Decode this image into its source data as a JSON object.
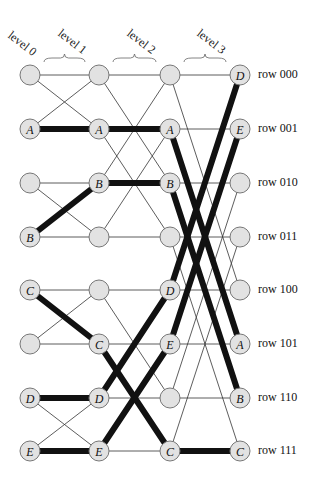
{
  "levels": [
    {
      "label": "level 0",
      "x": 30
    },
    {
      "label": "level 1",
      "x": 99
    },
    {
      "label": "level 2",
      "x": 170
    },
    {
      "label": "level 3",
      "x": 240
    }
  ],
  "rows": [
    {
      "label": "row 000",
      "y": 75
    },
    {
      "label": "row 001",
      "y": 129
    },
    {
      "label": "row 010",
      "y": 183
    },
    {
      "label": "row 011",
      "y": 237
    },
    {
      "label": "row 100",
      "y": 290
    },
    {
      "label": "row 101",
      "y": 344
    },
    {
      "label": "row 110",
      "y": 398
    },
    {
      "label": "row 111",
      "y": 451
    }
  ],
  "stage_bits": [
    1,
    2,
    4
  ],
  "colors": {
    "node_fill": "#e2e2e2",
    "node_stroke": "#777777",
    "thin_edge": "#333333",
    "path": "#111111"
  },
  "paths": [
    {
      "name": "A",
      "rows": [
        1,
        1,
        1,
        5
      ]
    },
    {
      "name": "B",
      "rows": [
        3,
        2,
        2,
        6
      ]
    },
    {
      "name": "C",
      "rows": [
        4,
        5,
        7,
        7
      ]
    },
    {
      "name": "D",
      "rows": [
        6,
        6,
        4,
        0
      ]
    },
    {
      "name": "E",
      "rows": [
        7,
        7,
        5,
        1
      ]
    }
  ]
}
